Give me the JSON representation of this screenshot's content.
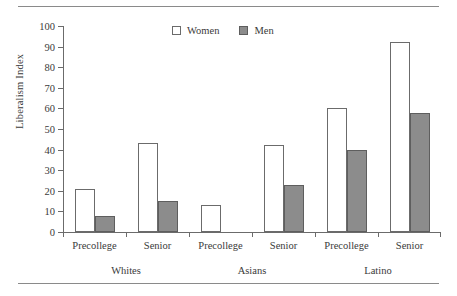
{
  "chart_data": {
    "type": "bar",
    "title": "",
    "subtitle": "",
    "xlabel": "",
    "ylabel": "Liberalism Index",
    "ylim": [
      0,
      100
    ],
    "ytick_step": 10,
    "yticks": [
      0,
      10,
      20,
      30,
      40,
      50,
      60,
      70,
      80,
      90,
      100
    ],
    "ytick_labels": [
      "0",
      "10",
      "20",
      "30",
      "40",
      "50",
      "60",
      "70",
      "80",
      "90",
      "100"
    ],
    "grid": false,
    "legend_position": "top-center",
    "categories": [
      "Precollege",
      "Senior",
      "Precollege",
      "Senior",
      "Precollege",
      "Senior"
    ],
    "groups": [
      {
        "label": "Whites",
        "categories": [
          "Precollege",
          "Senior"
        ]
      },
      {
        "label": "Asians",
        "categories": [
          "Precollege",
          "Senior"
        ]
      },
      {
        "label": "Latino",
        "categories": [
          "Precollege",
          "Senior"
        ]
      }
    ],
    "series": [
      {
        "name": "Women",
        "color": "#ffffff",
        "edge_color": "#6b6b6b",
        "values": [
          21,
          43,
          13,
          42,
          60,
          92
        ]
      },
      {
        "name": "Men",
        "color": "#8c8c8c",
        "edge_color": "#5e5e5e",
        "values": [
          8,
          15,
          0,
          23,
          40,
          58
        ]
      }
    ],
    "points": [
      {
        "group": "Whites",
        "category": "Precollege",
        "series": "Women",
        "value": 21
      },
      {
        "group": "Whites",
        "category": "Precollege",
        "series": "Men",
        "value": 8
      },
      {
        "group": "Whites",
        "category": "Senior",
        "series": "Women",
        "value": 43
      },
      {
        "group": "Whites",
        "category": "Senior",
        "series": "Men",
        "value": 15
      },
      {
        "group": "Asians",
        "category": "Precollege",
        "series": "Women",
        "value": 13
      },
      {
        "group": "Asians",
        "category": "Precollege",
        "series": "Men",
        "value": 0
      },
      {
        "group": "Asians",
        "category": "Senior",
        "series": "Women",
        "value": 42
      },
      {
        "group": "Asians",
        "category": "Senior",
        "series": "Men",
        "value": 23
      },
      {
        "group": "Latino",
        "category": "Precollege",
        "series": "Women",
        "value": 60
      },
      {
        "group": "Latino",
        "category": "Precollege",
        "series": "Men",
        "value": 40
      },
      {
        "group": "Latino",
        "category": "Senior",
        "series": "Women",
        "value": 92
      },
      {
        "group": "Latino",
        "category": "Senior",
        "series": "Men",
        "value": 58
      }
    ]
  },
  "legend": {
    "items": [
      {
        "label": "Women",
        "swatch": "white-square"
      },
      {
        "label": "Men",
        "swatch": "gray-square"
      }
    ]
  },
  "axis": {
    "y_title": "Liberalism Index"
  }
}
